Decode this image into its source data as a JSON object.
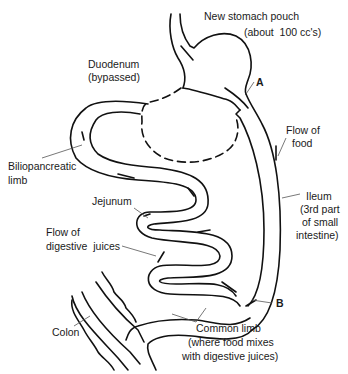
{
  "diagram": {
    "type": "anatomical-illustration",
    "colors": {
      "line": "#111111",
      "label_text": "#1a1a1a",
      "leader": "#555555",
      "background": "#ffffff"
    },
    "labels": {
      "stomach_pouch_1": "New stomach pouch",
      "stomach_pouch_2": "(about  100 cc's)",
      "duodenum_1": "Duodenum",
      "duodenum_2": "(bypassed)",
      "point_a": "A",
      "point_b": "B",
      "flow_food_1": "Flow of",
      "flow_food_2": "food",
      "biliopancreatic_1": "Biliopancreatic",
      "biliopancreatic_2": "limb",
      "ileum_1": "Ileum",
      "ileum_2": "(3rd part",
      "ileum_3": "of small",
      "ileum_4": "intestine)",
      "jejunum": "Jejunum",
      "flow_juices_1": "Flow of",
      "flow_juices_2": "digestive  juices",
      "colon": "Colon",
      "common_limb_1": "Common limb",
      "common_limb_2": "(where food mixes",
      "common_limb_3": "with digestive juices)"
    }
  }
}
